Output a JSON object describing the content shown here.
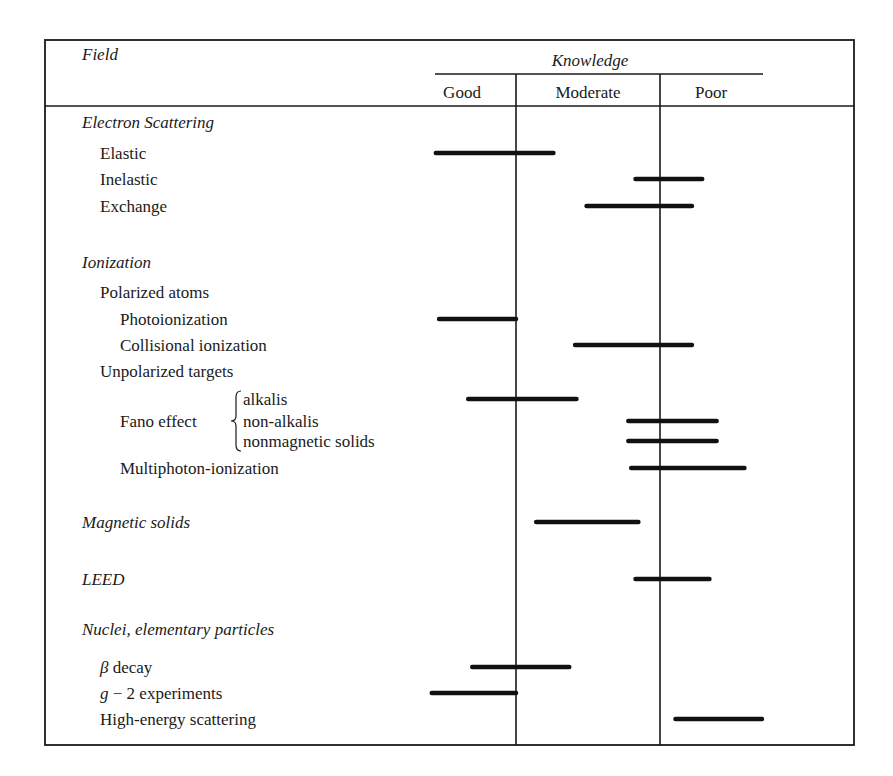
{
  "chart_data": {
    "type": "range-bar-table",
    "title": "",
    "header": {
      "field_label": "Field",
      "group_label": "Knowledge",
      "columns": [
        "Good",
        "Moderate",
        "Poor"
      ]
    },
    "scale": {
      "description": "Continuous knowledge scale: 0 = left edge of Good, 1 = Good/Moderate boundary, 2 = Moderate/Poor boundary, 3 = right edge of Poor",
      "range": [
        0,
        3
      ]
    },
    "rows": [
      {
        "label": "Electron Scattering",
        "kind": "section",
        "indent": 0
      },
      {
        "label": "Elastic",
        "kind": "item",
        "indent": 1,
        "range": [
          0.01,
          1.26
        ]
      },
      {
        "label": "Inelastic",
        "kind": "item",
        "indent": 1,
        "range": [
          1.83,
          2.41
        ]
      },
      {
        "label": "Exchange",
        "kind": "item",
        "indent": 1,
        "range": [
          1.49,
          2.31
        ]
      },
      {
        "label": "",
        "kind": "spacer"
      },
      {
        "label": "Ionization",
        "kind": "section",
        "indent": 0
      },
      {
        "label": "Polarized atoms",
        "kind": "subsection",
        "indent": 1
      },
      {
        "label": "Photoionization",
        "kind": "item",
        "indent": 2,
        "range": [
          0.05,
          1.0
        ]
      },
      {
        "label": "Collisional ionization",
        "kind": "item",
        "indent": 2,
        "range": [
          1.41,
          2.31
        ]
      },
      {
        "label": "Unpolarized targets",
        "kind": "subsection",
        "indent": 1
      },
      {
        "label": "alkalis",
        "kind": "brace-item",
        "group": "Fano effect",
        "range": [
          0.41,
          1.42
        ]
      },
      {
        "label": "non-alkalis",
        "kind": "brace-item",
        "group": "Fano effect",
        "range": [
          1.78,
          2.55
        ]
      },
      {
        "label": "nonmagnetic solids",
        "kind": "brace-item",
        "group": "Fano effect",
        "range": [
          1.78,
          2.55
        ]
      },
      {
        "label": "Multiphoton-ionization",
        "kind": "item",
        "indent": 2,
        "range": [
          1.8,
          2.82
        ]
      },
      {
        "label": "",
        "kind": "spacer"
      },
      {
        "label": "Magnetic solids",
        "kind": "section",
        "indent": 0,
        "range": [
          1.14,
          1.85
        ]
      },
      {
        "label": "",
        "kind": "spacer"
      },
      {
        "label": "LEED",
        "kind": "section",
        "indent": 0,
        "range": [
          1.83,
          2.48
        ]
      },
      {
        "label": "",
        "kind": "spacer"
      },
      {
        "label": "Nuclei, elementary particles",
        "kind": "section",
        "indent": 0
      },
      {
        "label": "β decay",
        "kind": "item",
        "indent": 1,
        "range": [
          0.46,
          1.37
        ],
        "italic_prefix": "β",
        "rest": " decay"
      },
      {
        "label": "g − 2 experiments",
        "kind": "item",
        "indent": 1,
        "range": [
          -0.04,
          1.0
        ],
        "italic_prefix": "g",
        "rest": " − 2 experiments"
      },
      {
        "label": "High-energy scattering",
        "kind": "item",
        "indent": 1,
        "range": [
          2.15,
          2.99
        ]
      }
    ],
    "brace_group_label": "Fano effect",
    "colors": {
      "ink": "#1a1a1a",
      "bar": "#111111",
      "background": "#ffffff"
    }
  }
}
